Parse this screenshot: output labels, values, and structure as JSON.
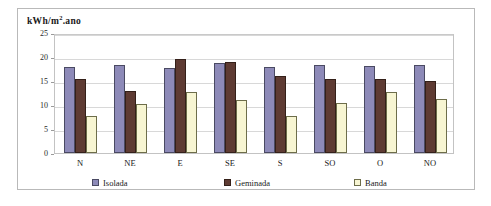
{
  "chart_data": {
    "type": "bar",
    "title": "",
    "subtitle": "",
    "xlabel": "",
    "ylabel": "kWh/m².ano",
    "ylabel_parts": {
      "prefix": "kWh/m",
      "sup": "2",
      "suffix": ".ano"
    },
    "ylim": [
      0,
      25
    ],
    "ytick_labels": [
      "25",
      "20",
      "15",
      "10",
      "5",
      "0"
    ],
    "ytick_values": [
      25,
      20,
      15,
      10,
      5,
      0
    ],
    "grid": true,
    "grid_axis": "y",
    "legend_position": "bottom",
    "categories": [
      "N",
      "NE",
      "E",
      "SE",
      "S",
      "SO",
      "O",
      "NO"
    ],
    "series": [
      {
        "name": "Isolada",
        "color": "#8d8ab8",
        "values": [
          17.9,
          18.3,
          17.8,
          18.7,
          18.0,
          18.4,
          18.2,
          18.4
        ]
      },
      {
        "name": "Geminada",
        "color": "#5e3b33",
        "values": [
          15.4,
          13.0,
          19.6,
          18.9,
          16.0,
          15.4,
          15.5,
          14.9
        ]
      },
      {
        "name": "Banda",
        "color": "#f7f5d2",
        "values": [
          7.8,
          10.3,
          12.8,
          11.0,
          7.8,
          10.4,
          12.7,
          11.3
        ]
      }
    ]
  }
}
